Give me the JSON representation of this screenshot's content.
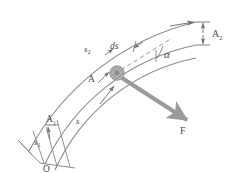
{
  "figure": {
    "background_color": "#ffffff",
    "line_color": "#8a8a8a",
    "dark_line_color": "#6f6f6f",
    "label_color": "#4a4a4a",
    "force_arrow_color": "#9a9a9a",
    "particle_color": "#a0a0a0"
  },
  "labels": {
    "origin": "O",
    "arc_s": "s",
    "arc_s1": "s",
    "arc_s1_sub": "1",
    "arc_s2": "s",
    "arc_s2_sub": "2",
    "point_A": "A",
    "point_A1": "A",
    "point_A1_sub": "1",
    "point_A2": "A",
    "point_A2_sub": "2",
    "differential": "ds",
    "angle": "α",
    "force": "F"
  },
  "geometry": {
    "center_x": 14,
    "center_y": 300,
    "radius_inner": 196,
    "radius_middle": 214,
    "radius_outer": 258,
    "particle_x": 117,
    "particle_y": 73,
    "force_angle_deg": 38,
    "alpha_label_position": "between tangent and force vector"
  },
  "annotations": [
    {
      "name": "arc-length-s",
      "text": "s",
      "desc": "arc length from O to A along path"
    },
    {
      "name": "arc-length-s1",
      "text": "s1",
      "desc": "arc length from O to A1"
    },
    {
      "name": "arc-length-s2",
      "text": "s2",
      "desc": "arc length from O to A2"
    },
    {
      "name": "ds-element",
      "text": "ds",
      "desc": "differential arc element at A"
    },
    {
      "name": "alpha-angle",
      "text": "alpha",
      "desc": "angle between force F and tangent"
    },
    {
      "name": "force-vector",
      "text": "F",
      "desc": "applied force at particle A"
    }
  ]
}
